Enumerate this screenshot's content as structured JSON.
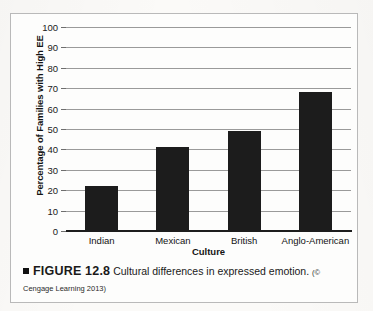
{
  "figure": {
    "frame_border_color": "#b9b9b9",
    "bullet_icon": "black-square-bullet",
    "label": "FIGURE 12.8",
    "caption_text": "Cultural differences in expressed emotion.",
    "credit": "(© Cengage Learning 2013)"
  },
  "chart_data": {
    "type": "bar",
    "title": "",
    "categories": [
      "Indian",
      "Mexican",
      "British",
      "Anglo-American"
    ],
    "values": [
      22,
      41,
      49,
      68
    ],
    "xlabel": "Culture",
    "ylabel": "Percentage of Families with High EE",
    "ylim": [
      0,
      100
    ],
    "ytick_labels": [
      "100",
      "90",
      "80",
      "70",
      "60",
      "50",
      "40",
      "30",
      "20",
      "10",
      "0"
    ],
    "ytick_values": [
      100,
      90,
      80,
      70,
      60,
      50,
      40,
      30,
      20,
      10,
      0
    ],
    "ytick_step": 10,
    "grid": true,
    "grid_axis": "y",
    "legend": false,
    "bar_color": "#1c1c1c",
    "gridline_color": "#9a9a9a",
    "axis_color": "#1d1d1d"
  }
}
